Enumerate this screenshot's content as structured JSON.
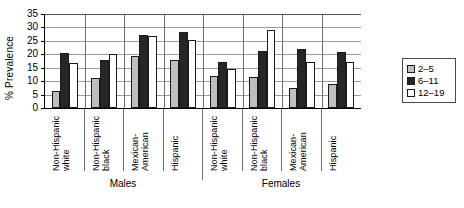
{
  "chart_data": {
    "type": "bar",
    "title": "",
    "xlabel": "",
    "ylabel": "% Prevalence",
    "ylim": [
      0,
      35
    ],
    "ytick_labels": [
      "0",
      "5",
      "10",
      "15",
      "20",
      "25",
      "30",
      "35"
    ],
    "yticks": [
      0,
      5,
      10,
      15,
      20,
      25,
      30,
      35
    ],
    "grid": true,
    "legend_position": "right",
    "categories": [
      "Non-Hispanic\nwhite",
      "Non-Hispanic\nblack",
      "Mexican-\nAmerican",
      "Hispanic",
      "Non-Hispanic\nwhite",
      "Non-Hispanic\nblack",
      "Mexican-\nAmerican",
      "Hispanic"
    ],
    "supergroups": [
      {
        "label": "Males",
        "span": 4
      },
      {
        "label": "Females",
        "span": 4
      }
    ],
    "series": [
      {
        "name": "2–5",
        "color": "#bfbfbf",
        "values": [
          6.5,
          11.2,
          19.4,
          17.9,
          11.9,
          11.6,
          7.3,
          9.0
        ]
      },
      {
        "name": "6–11",
        "color": "#262626",
        "values": [
          20.6,
          17.7,
          27.1,
          28.3,
          17.3,
          21.1,
          22.1,
          21.0
        ]
      },
      {
        "name": "12–19",
        "color": "#ffffff",
        "values": [
          16.7,
          20.0,
          26.8,
          25.5,
          14.5,
          29.0,
          17.2,
          17.3
        ]
      }
    ]
  },
  "legend": {
    "items": [
      {
        "label": "2–5"
      },
      {
        "label": "6–11"
      },
      {
        "label": "12–19"
      }
    ]
  }
}
